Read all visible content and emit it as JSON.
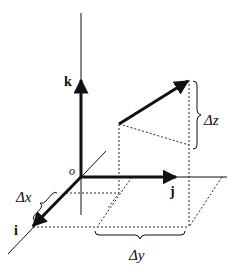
{
  "diagram": {
    "type": "3d-vector-components",
    "colors": {
      "stroke": "#111111",
      "background": "#ffffff"
    },
    "labels": {
      "k": "k",
      "j": "j",
      "i": "i",
      "origin": "o",
      "dx": "Δx",
      "dy": "Δy",
      "dz": "Δz"
    },
    "axes": [
      {
        "name": "k",
        "direction": "up"
      },
      {
        "name": "j",
        "direction": "right"
      },
      {
        "name": "i",
        "direction": "toward-viewer (down-left)"
      }
    ],
    "vector": {
      "from": "lower-left point above plane",
      "to": "upper-right point"
    },
    "components": [
      "Δx",
      "Δy",
      "Δz"
    ]
  }
}
